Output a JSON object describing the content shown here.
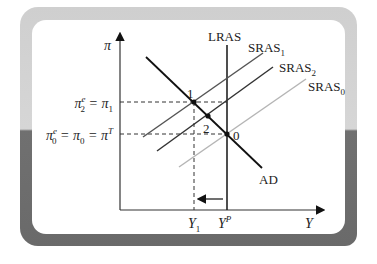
{
  "diagram": {
    "axes": {
      "y_label": "π",
      "x_label": "Y"
    },
    "y_ticks": [
      {
        "label_main": "π",
        "label_sup": "e",
        "label_sub": "2",
        "label_rest": " = π",
        "label_rest_sub": "1",
        "y": 102
      },
      {
        "label_main": "π",
        "label_sup": "e",
        "label_sub": "0",
        "label_rest": " = π",
        "label_rest_sub": "0",
        "label_tail": " = π",
        "label_tail_sup": "T",
        "y": 134
      }
    ],
    "x_ticks": [
      {
        "label_main": "Y",
        "label_sub": "1",
        "x": 194
      },
      {
        "label_main": "Y",
        "label_sup": "P",
        "x": 227
      }
    ],
    "curves": [
      {
        "name": "LRAS",
        "label": "LRAS",
        "color": "#222222"
      },
      {
        "name": "SRAS1",
        "label_main": "SRAS",
        "label_sub": "1",
        "color": "#555555"
      },
      {
        "name": "SRAS2",
        "label_main": "SRAS",
        "label_sub": "2",
        "color": "#333333"
      },
      {
        "name": "SRAS0",
        "label_main": "SRAS",
        "label_sub": "0",
        "color": "#b5b5b5"
      },
      {
        "name": "AD",
        "label": "AD",
        "color": "#111111"
      }
    ],
    "points": [
      {
        "label": "1",
        "x": 194,
        "y": 102
      },
      {
        "label": "2",
        "x": 208,
        "y": 116
      },
      {
        "label": "0",
        "x": 227,
        "y": 134
      }
    ],
    "arrow": {
      "direction": "left",
      "meaning": "output falls from Y^P to Y1"
    }
  }
}
